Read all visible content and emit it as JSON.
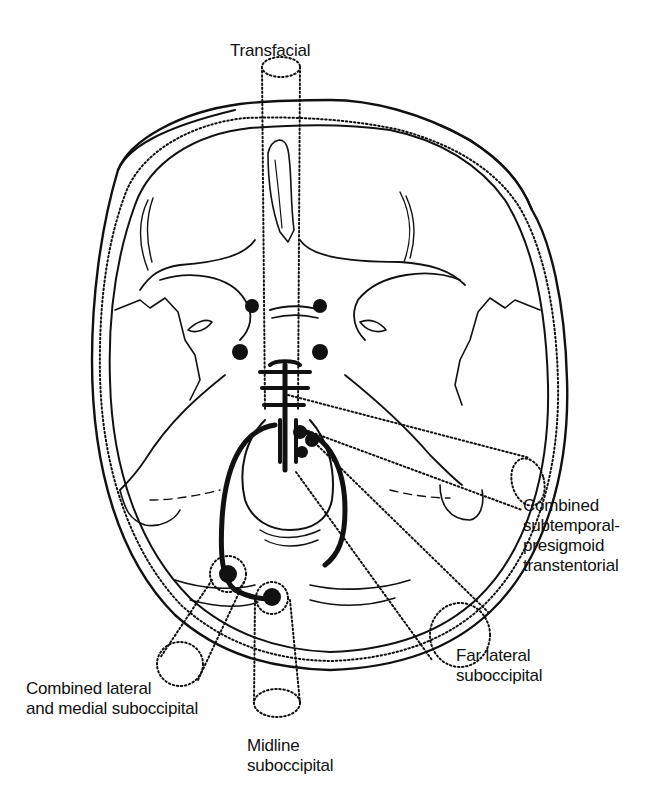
{
  "figure": {
    "ink_color": "#111111",
    "background_color": "#ffffff"
  },
  "labels": {
    "transfacial": {
      "lines": [
        "Transfacial"
      ]
    },
    "combined_subtemporal": {
      "lines": [
        "Combined",
        "subtemporal-",
        "presigmoid",
        "transtentorial"
      ]
    },
    "far_lateral": {
      "lines": [
        "Far lateral",
        "suboccipital"
      ]
    },
    "midline": {
      "lines": [
        "Midline",
        "suboccipital"
      ]
    },
    "combined_lateral_medial": {
      "lines": [
        "Combined lateral",
        "and medial suboccipital"
      ]
    }
  },
  "approaches": [
    {
      "id": "transfacial",
      "name": "Transfacial",
      "style": "dotted-cylinder"
    },
    {
      "id": "combined_subtemporal",
      "name": "Combined subtemporal-presigmoid transtentorial",
      "style": "dotted-cylinder"
    },
    {
      "id": "far_lateral",
      "name": "Far lateral suboccipital",
      "style": "dotted-cylinder"
    },
    {
      "id": "midline",
      "name": "Midline suboccipital",
      "style": "dotted-cylinder"
    },
    {
      "id": "combined_lateral_medial",
      "name": "Combined lateral and medial suboccipital",
      "style": "dotted-cylinder"
    }
  ]
}
